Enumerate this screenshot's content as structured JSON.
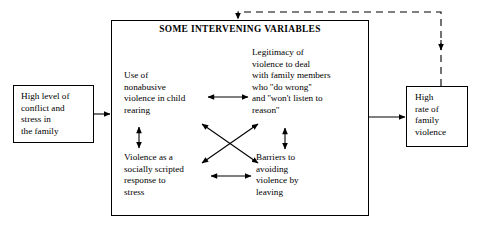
{
  "diagram": {
    "title": "SOME INTERVENING VARIABLES",
    "antecedent_box": {
      "label": "High level of\nconflict and\nstress in\nthe family"
    },
    "outcome_box": {
      "label": "High\nrate of\nfamily\nviolence"
    },
    "nodes": [
      {
        "id": "child-rearing",
        "label": "Use of\nnonabusive\nviolence in child\nrearing"
      },
      {
        "id": "legitimacy",
        "label": "Legitimacy of\nviolence to deal\nwith family members\nwho ''do wrong''\nand ''won't listen to\nreason''"
      },
      {
        "id": "socially-scripted",
        "label": "Violence as a\nsocially scripted\nresponse to\nstress"
      },
      {
        "id": "barriers",
        "label": "Barriers to\navoiding\nviolence by\nleaving"
      }
    ],
    "connectors": [
      {
        "id": "antecedent-to-panel",
        "style": "solid",
        "heads": "single"
      },
      {
        "id": "panel-to-outcome",
        "style": "solid",
        "heads": "single"
      },
      {
        "id": "child-rearing-to-legitimacy",
        "style": "solid",
        "heads": "double"
      },
      {
        "id": "scripted-to-barriers",
        "style": "solid",
        "heads": "double"
      },
      {
        "id": "child-rearing-to-scripted",
        "style": "solid",
        "heads": "double"
      },
      {
        "id": "legitimacy-to-barriers",
        "style": "solid",
        "heads": "double"
      },
      {
        "id": "child-rearing-to-barriers-diagonal",
        "style": "solid",
        "heads": "double"
      },
      {
        "id": "scripted-to-legitimacy-diagonal",
        "style": "solid",
        "heads": "double"
      },
      {
        "id": "feedback-loop",
        "style": "dashed",
        "heads": "double"
      }
    ],
    "colors": {
      "stroke": "#000000",
      "background": "#ffffff",
      "text": "#000000"
    }
  }
}
